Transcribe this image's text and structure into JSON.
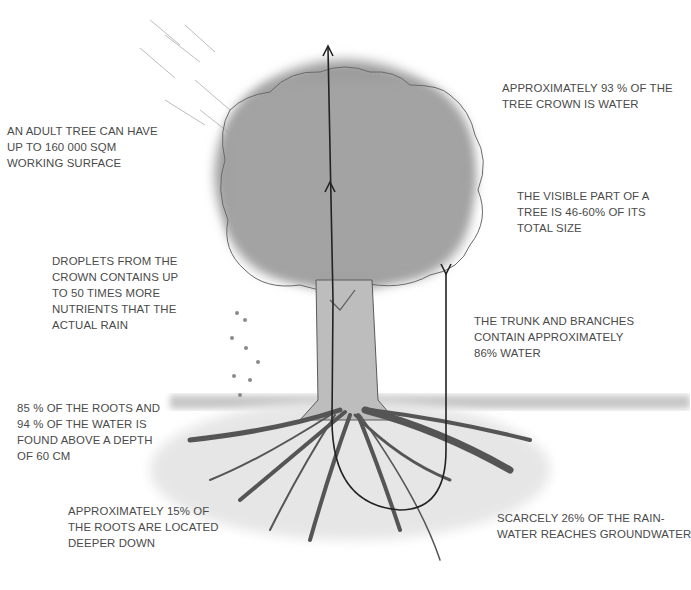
{
  "figure": {
    "type": "annotated illustration",
    "colors": {
      "text": "#4a4a4a",
      "crown": "#9a9a9a",
      "roots": "#5a5a5a",
      "arrow": "#222222"
    }
  },
  "annotations": {
    "working_surface": {
      "lines": [
        "AN ADULT TREE CAN HAVE",
        "UP TO 160 000 SQM",
        "WORKING SURFACE"
      ]
    },
    "crown_water": {
      "lines": [
        "APPROXIMATELY 93 % OF THE",
        "TREE CROWN IS WATER"
      ]
    },
    "visible_part": {
      "lines": [
        "THE VISIBLE PART OF A",
        "TREE IS 46-60% OF ITS",
        "TOTAL SIZE"
      ]
    },
    "droplets": {
      "lines": [
        "DROPLETS FROM THE",
        "CROWN CONTAINS UP",
        "TO 50 TIMES MORE",
        "NUTRIENTS THAT THE",
        "ACTUAL RAIN"
      ]
    },
    "trunk_water": {
      "lines": [
        "THE TRUNK AND BRANCHES",
        "CONTAIN APPROXIMATELY",
        "86% WATER"
      ]
    },
    "roots_depth": {
      "lines": [
        "85 % OF THE ROOTS AND",
        "94 % OF THE WATER IS",
        "FOUND ABOVE A DEPTH",
        "OF 60 CM"
      ]
    },
    "deep_roots": {
      "lines": [
        "APPROXIMATELY 15% OF",
        "THE ROOTS ARE LOCATED",
        "DEEPER DOWN"
      ]
    },
    "groundwater": {
      "lines": [
        "SCARCELY 26% OF THE RAIN-",
        "WATER REACHES GROUNDWATER"
      ]
    }
  },
  "caption": {
    "text": "",
    "note": "caption clipped at bottom edge, illegible"
  }
}
